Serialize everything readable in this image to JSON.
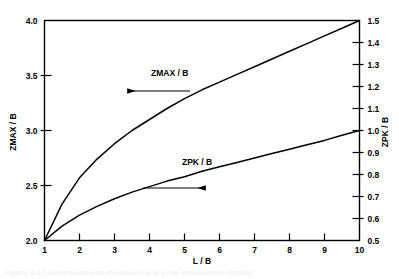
{
  "chart_data": {
    "type": "line",
    "title": "",
    "xlabel": "L / B",
    "ylabel": "ZMAX / B",
    "ylabel_right": "ZPK / B",
    "xlim": [
      1,
      10
    ],
    "ylim": [
      2.0,
      4.0
    ],
    "ylim_right": [
      0.5,
      1.5
    ],
    "grid": false,
    "legend_position": "inline-annotations",
    "x_ticks": [
      "1",
      "2",
      "3",
      "4",
      "5",
      "6",
      "7",
      "8",
      "9",
      "10"
    ],
    "x_tick_values": [
      1,
      2,
      3,
      4,
      5,
      6,
      7,
      8,
      9,
      10
    ],
    "y_ticks_left": [
      "2.0",
      "2.5",
      "3.0",
      "3.5",
      "4.0"
    ],
    "y_tick_values_left": [
      2.0,
      2.5,
      3.0,
      3.5,
      4.0
    ],
    "y_ticks_right": [
      "0.5",
      "0.6",
      "0.7",
      "0.8",
      "0.9",
      "1.0",
      "1.1",
      "1.2",
      "1.3",
      "1.4",
      "1.5"
    ],
    "y_tick_values_right": [
      0.5,
      0.6,
      0.7,
      0.8,
      0.9,
      1.0,
      1.1,
      1.2,
      1.3,
      1.4,
      1.5
    ],
    "series": [
      {
        "name": "ZMAX / B",
        "axis": "left",
        "annotation": "ZMAX / B",
        "annotation_arrow": "left",
        "x": [
          1,
          1.5,
          2,
          2.5,
          3,
          3.5,
          4,
          4.5,
          5,
          5.5,
          6,
          6.5,
          7,
          7.5,
          8,
          8.5,
          9,
          9.5,
          10
        ],
        "values": [
          2.0,
          2.33,
          2.57,
          2.74,
          2.88,
          3.0,
          3.1,
          3.2,
          3.29,
          3.37,
          3.44,
          3.51,
          3.58,
          3.65,
          3.72,
          3.79,
          3.86,
          3.93,
          4.0
        ]
      },
      {
        "name": "ZPK / B",
        "axis": "right",
        "annotation": "ZPK / B",
        "annotation_arrow": "right",
        "x": [
          1,
          1.5,
          2,
          2.5,
          3,
          3.5,
          4,
          4.5,
          5,
          5.5,
          6,
          6.5,
          7,
          7.5,
          8,
          8.5,
          9,
          9.5,
          10
        ],
        "values": [
          0.5,
          0.565,
          0.615,
          0.655,
          0.69,
          0.72,
          0.745,
          0.77,
          0.79,
          0.815,
          0.835,
          0.855,
          0.875,
          0.895,
          0.915,
          0.935,
          0.955,
          0.978,
          1.0
        ]
      }
    ]
  },
  "axis_titles": {
    "left": "ZMAX / B",
    "right": "ZPK / B",
    "bottom": "L / B"
  },
  "annotations": {
    "zmax_label": "ZMAX / B",
    "zpk_label": "ZPK / B"
  },
  "caption": {
    "text": "Figure 4-13  Dimensionless maximum and peak embedment depths"
  },
  "colors": {
    "axis": "#000000",
    "curve": "#000000",
    "background": "#ffffff"
  }
}
